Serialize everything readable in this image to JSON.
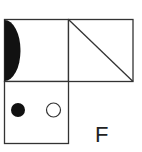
{
  "figure": {
    "label": "F",
    "panels": [
      {
        "position": "top-left",
        "content": "filled half-disc on left edge"
      },
      {
        "position": "top-right",
        "content": "diagonal from top-left to bottom-right"
      },
      {
        "position": "bottom-left",
        "content": "filled circle and hollow circle"
      }
    ]
  },
  "colors": {
    "stroke": "#333333",
    "fill": "#111111",
    "background": "#ffffff"
  }
}
